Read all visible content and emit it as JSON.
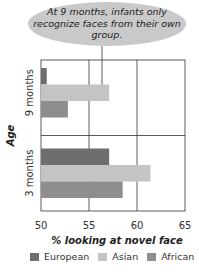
{
  "callout": {
    "text": "At 9 months, infants only recognize faces from their own group."
  },
  "chart_data": {
    "type": "bar",
    "orientation": "horizontal",
    "title": "",
    "xlabel": "% looking at novel face",
    "ylabel": "Age",
    "xlim": [
      50,
      65
    ],
    "xticks": [
      50,
      55,
      60,
      65
    ],
    "categories": [
      "9 months",
      "3 months"
    ],
    "series": [
      {
        "name": "European",
        "color": "#6e6e6e",
        "values": [
          50.6,
          57.1
        ]
      },
      {
        "name": "Asian",
        "color": "#c4c4c4",
        "values": [
          57.1,
          61.4
        ]
      },
      {
        "name": "African",
        "color": "#8e8e8e",
        "values": [
          52.8,
          58.5
        ]
      }
    ],
    "grid": true,
    "legend": "bottom"
  }
}
